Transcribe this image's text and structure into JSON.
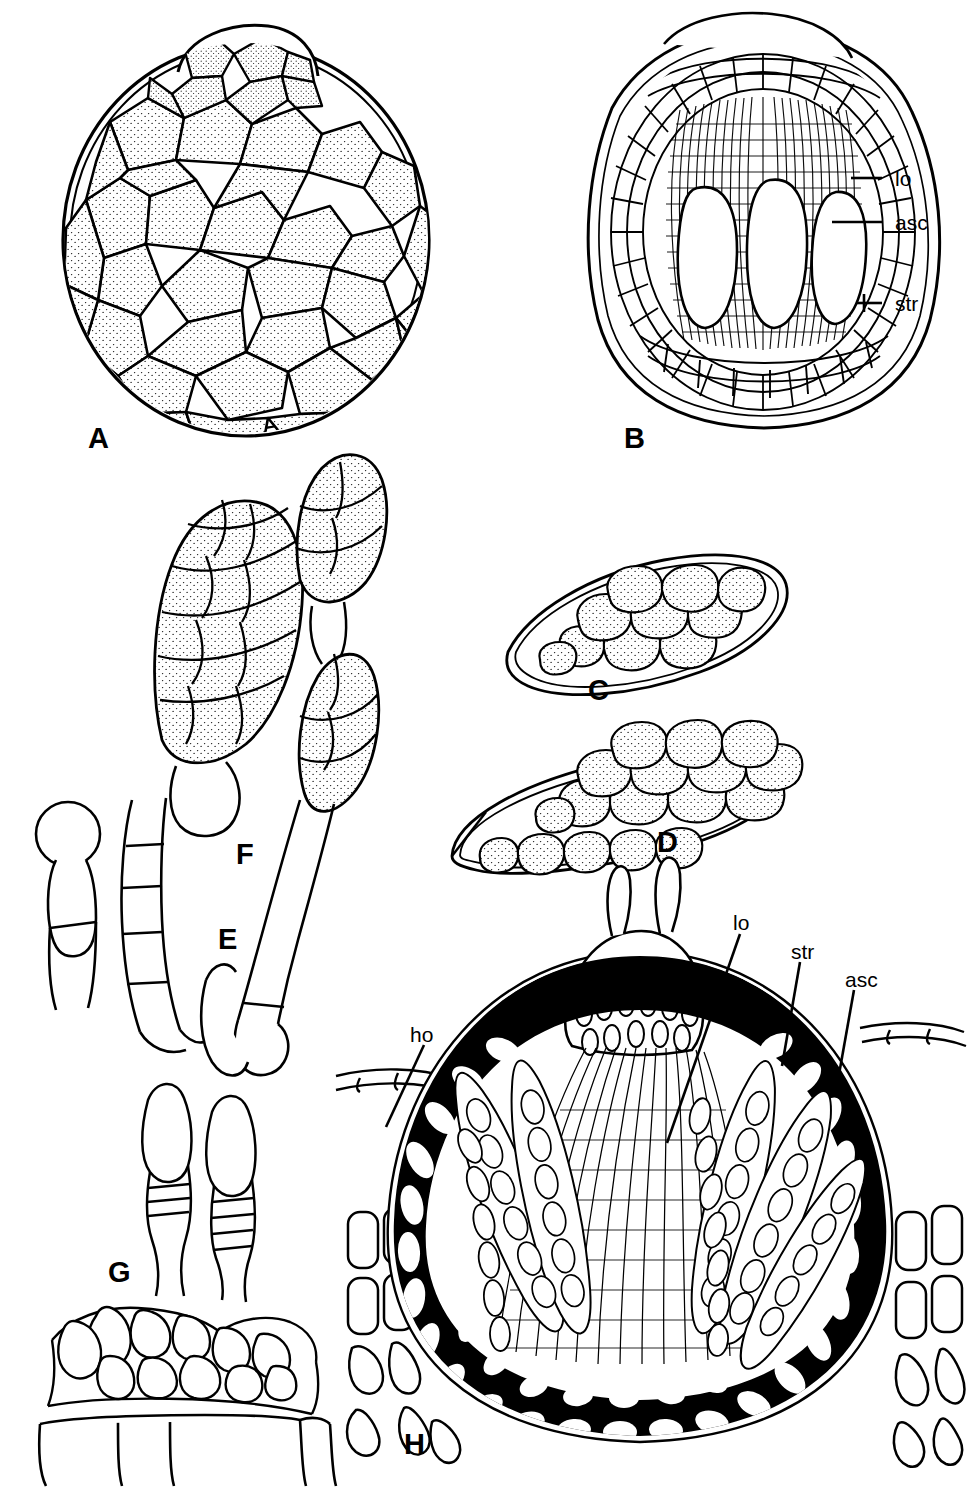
{
  "figure": {
    "background_color": "#ffffff",
    "ink_color": "#000000",
    "width": 967,
    "height": 1490
  },
  "panels": [
    {
      "letter": "A",
      "name": "ascoma-surface-view",
      "description": "Whole ascoma in surface view, pseudoparenchymatous stippled cells",
      "letter_x": 88,
      "letter_y": 424
    },
    {
      "letter": "B",
      "name": "ascoma-vertical-section",
      "description": "Vertical section of multiloculate ascostroma showing three locules",
      "letter_x": 624,
      "letter_y": 424
    },
    {
      "letter": "C",
      "name": "ascus-with-ascospore-single",
      "description": "Ascus containing a muriform ascospore",
      "letter_x": 588,
      "letter_y": 676
    },
    {
      "letter": "D",
      "name": "ascus-with-ascospores-two",
      "description": "Ascus with two overlapping muriform ascospores",
      "letter_x": 657,
      "letter_y": 828
    },
    {
      "letter": "E",
      "name": "ascospore-on-germ-hypha",
      "description": "Germinating ascospore with basal cells and young conidium",
      "letter_x": 218,
      "letter_y": 925
    },
    {
      "letter": "F",
      "name": "ascospore-chain",
      "description": "Two-celled muriform spore chain on a stalk",
      "letter_x": 236,
      "letter_y": 840
    },
    {
      "letter": "G",
      "name": "spermatogenous-cells",
      "description": "Spermatogenous cells (phialides) arising from pseudoparenchymatous base",
      "letter_x": 108,
      "letter_y": 1258
    },
    {
      "letter": "H",
      "name": "pseudothecium-section",
      "description": "Vertical section of thick-walled ascoma with carbonaceous excipulum and host tissue",
      "letter_x": 404,
      "letter_y": 1430
    }
  ],
  "annotations": {
    "panel_b": [
      {
        "text": "lo",
        "name": "label-locule",
        "x": 895,
        "y": 168,
        "leader_x1": 857,
        "leader_y1": 178,
        "leader_x2": 880,
        "leader_y2": 178,
        "tick": false
      },
      {
        "text": "asc",
        "name": "label-ascus",
        "x": 895,
        "y": 212,
        "leader_x1": 838,
        "leader_y1": 222,
        "leader_x2": 880,
        "leader_y2": 222,
        "tick": false
      },
      {
        "text": "str",
        "name": "label-stroma",
        "x": 895,
        "y": 293,
        "leader_x1": 858,
        "leader_y1": 303,
        "leader_x2": 880,
        "leader_y2": 303,
        "tick": true
      }
    ],
    "panel_h": [
      {
        "text": "ho",
        "name": "label-host-tissue",
        "x": 410,
        "y": 1024,
        "leader_x1": 424,
        "leader_y1": 1045,
        "leader_x2": 386,
        "leader_y2": 1127
      },
      {
        "text": "lo",
        "name": "label-locule",
        "x": 733,
        "y": 912,
        "leader_x1": 740,
        "leader_y1": 934,
        "leader_x2": 667,
        "leader_y2": 1143
      },
      {
        "text": "str",
        "name": "label-stroma",
        "x": 791,
        "y": 941,
        "leader_x1": 800,
        "leader_y1": 962,
        "leader_x2": 782,
        "leader_y2": 1066
      },
      {
        "text": "asc",
        "name": "label-ascus",
        "x": 845,
        "y": 969,
        "leader_x1": 854,
        "leader_y1": 990,
        "leader_x2": 838,
        "leader_y2": 1080
      }
    ]
  },
  "legend_terms": [
    {
      "abbr": "lo",
      "meaning": "locule"
    },
    {
      "abbr": "asc",
      "meaning": "ascus"
    },
    {
      "abbr": "str",
      "meaning": "stroma"
    },
    {
      "abbr": "ho",
      "meaning": "host tissue"
    }
  ]
}
